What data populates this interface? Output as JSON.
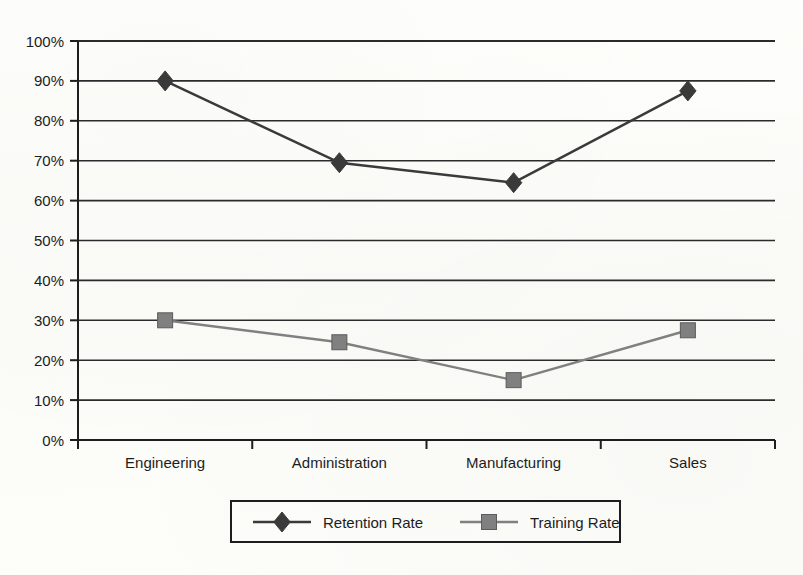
{
  "chart_data": {
    "type": "line",
    "title": "",
    "subtitle": "",
    "xlabel": "",
    "ylabel": "",
    "categories": [
      "Engineering",
      "Administration",
      "Manufacturing",
      "Sales"
    ],
    "series": [
      {
        "name": "Retention Rate",
        "values": [
          90,
          69.5,
          64.5,
          87.5
        ],
        "color": "#3a3a3a",
        "marker": "diamond"
      },
      {
        "name": "Training Rate",
        "values": [
          30,
          24.5,
          15,
          27.5
        ],
        "color": "#808080",
        "marker": "square"
      }
    ],
    "ylim": [
      0,
      100
    ],
    "ytick_values": [
      0,
      10,
      20,
      30,
      40,
      50,
      60,
      70,
      80,
      90,
      100
    ],
    "ytick_labels": [
      "0%",
      "10%",
      "20%",
      "30%",
      "40%",
      "50%",
      "60%",
      "70%",
      "80%",
      "90%",
      "100%"
    ],
    "grid": "horizontal",
    "legend_position": "bottom",
    "value_format": "percent"
  },
  "axis": {
    "y_ticks": [
      {
        "label": "100%",
        "value": 100
      },
      {
        "label": "90%",
        "value": 90
      },
      {
        "label": "80%",
        "value": 80
      },
      {
        "label": "70%",
        "value": 70
      },
      {
        "label": "60%",
        "value": 60
      },
      {
        "label": "50%",
        "value": 50
      },
      {
        "label": "40%",
        "value": 40
      },
      {
        "label": "30%",
        "value": 30
      },
      {
        "label": "20%",
        "value": 20
      },
      {
        "label": "10%",
        "value": 10
      },
      {
        "label": "0%",
        "value": 0
      }
    ],
    "x_categories": [
      {
        "label": "Engineering"
      },
      {
        "label": "Administration"
      },
      {
        "label": "Manufacturing"
      },
      {
        "label": "Sales"
      }
    ]
  },
  "legend": {
    "items": [
      {
        "label": "Retention Rate",
        "color": "#3a3a3a",
        "marker": "diamond-marker"
      },
      {
        "label": "Training Rate",
        "color": "#808080",
        "marker": "square-marker"
      }
    ]
  },
  "colors": {
    "retention": "#3a3a3a",
    "training": "#808080",
    "axis": "#1d1d1d",
    "grid": "#2b2b2b",
    "background": "#fdfdfb"
  }
}
